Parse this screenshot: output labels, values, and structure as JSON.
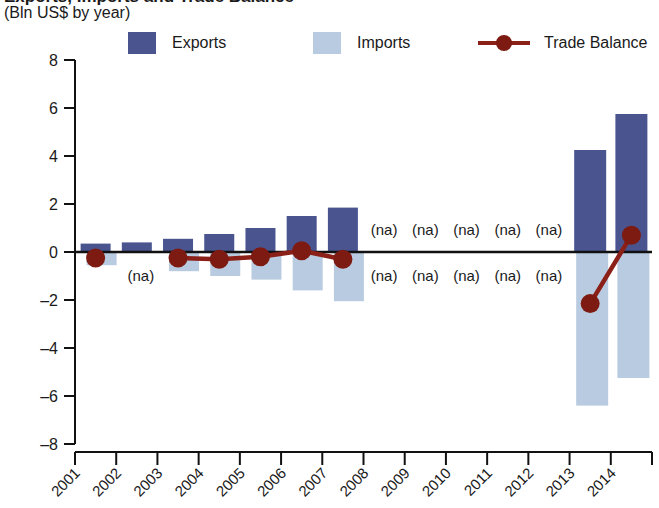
{
  "header": {
    "title": "Exports, Imports and Trade Balance",
    "subtitle": "(Bln US$ by year)"
  },
  "legend": {
    "items": [
      {
        "label": "Exports",
        "type": "swatch",
        "color": "#4a5590"
      },
      {
        "label": "Imports",
        "type": "swatch",
        "color": "#b9cbe0"
      },
      {
        "label": "Trade Balance",
        "type": "line",
        "color": "#8b2018"
      }
    ]
  },
  "axes": {
    "y_ticks": [
      "8",
      "6",
      "4",
      "2",
      "0",
      "-2",
      "-4",
      "-6",
      "-8"
    ],
    "x_ticks": [
      "2001",
      "2002",
      "2003",
      "2004",
      "2005",
      "2006",
      "2007",
      "2008",
      "2009",
      "2010",
      "2011",
      "2012",
      "2013",
      "2014"
    ]
  },
  "na_text": "(na)",
  "colors": {
    "exports": "#4a5590",
    "imports": "#b9cbe0",
    "balance": "#8b2018",
    "axis": "#111111"
  },
  "chart_data": {
    "type": "bar",
    "title": "Exports, Imports and Trade Balance",
    "subtitle": "(Bln US$ by year)",
    "xlabel": "",
    "ylabel": "Bln US$",
    "ylim": [
      -8,
      8
    ],
    "ytick_step": 2,
    "grid": false,
    "legend_position": "top",
    "categories": [
      "2001",
      "2002",
      "2003",
      "2004",
      "2005",
      "2006",
      "2007",
      "2008",
      "2009",
      "2010",
      "2011",
      "2012",
      "2013",
      "2014"
    ],
    "series": [
      {
        "name": "Exports",
        "type": "bar",
        "color": "#4a5590",
        "values": [
          0.35,
          0.4,
          0.55,
          0.75,
          1.0,
          1.5,
          1.85,
          null,
          null,
          null,
          null,
          null,
          4.25,
          5.75
        ]
      },
      {
        "name": "Imports",
        "type": "bar",
        "color": "#b9cbe0",
        "values": [
          -0.55,
          null,
          -0.8,
          -1.0,
          -1.15,
          -1.6,
          -2.05,
          null,
          null,
          null,
          null,
          null,
          -6.4,
          -5.25
        ]
      },
      {
        "name": "Trade Balance",
        "type": "line",
        "color": "#8b2018",
        "values": [
          -0.25,
          null,
          -0.25,
          -0.3,
          -0.2,
          0.05,
          -0.3,
          null,
          null,
          null,
          null,
          null,
          -2.15,
          0.7
        ]
      }
    ],
    "na_categories": [
      "2008",
      "2009",
      "2010",
      "2011",
      "2012"
    ],
    "na_label": "(na)"
  }
}
